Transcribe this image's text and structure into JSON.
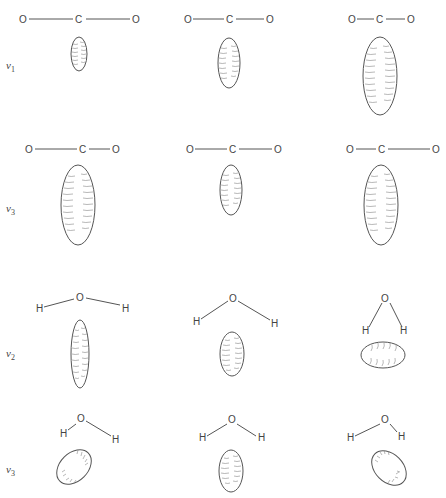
{
  "figure": {
    "colors": {
      "line": "#555555",
      "hatch": "#777777",
      "background": "#ffffff"
    }
  },
  "rows": [
    {
      "id": "co2-nu1",
      "label_symbol": "ν",
      "label_subscript": "1",
      "molecule": "CO2",
      "panels": [
        {
          "atoms": [
            "O",
            "C",
            "O"
          ],
          "geometry": "linear-stretched",
          "ellipsoid": "small-vertical"
        },
        {
          "atoms": [
            "O",
            "C",
            "O"
          ],
          "geometry": "linear-equilibrium",
          "ellipsoid": "medium-vertical"
        },
        {
          "atoms": [
            "O",
            "C",
            "O"
          ],
          "geometry": "linear-compressed",
          "ellipsoid": "large-vertical"
        }
      ]
    },
    {
      "id": "co2-nu3",
      "label_symbol": "ν",
      "label_subscript": "3",
      "molecule": "CO2",
      "panels": [
        {
          "atoms": [
            "O",
            "C",
            "O"
          ],
          "geometry": "asymmetric-left",
          "ellipsoid": "large-vertical"
        },
        {
          "atoms": [
            "O",
            "C",
            "O"
          ],
          "geometry": "linear-equilibrium",
          "ellipsoid": "medium-vertical"
        },
        {
          "atoms": [
            "O",
            "C",
            "O"
          ],
          "geometry": "asymmetric-right",
          "ellipsoid": "large-vertical"
        }
      ]
    },
    {
      "id": "h2o-nu2",
      "label_symbol": "ν",
      "label_subscript": "2",
      "molecule": "H2O",
      "panels": [
        {
          "atoms": [
            "H",
            "O",
            "H"
          ],
          "geometry": "bent-wide",
          "ellipsoid": "tall-vertical"
        },
        {
          "atoms": [
            "H",
            "O",
            "H"
          ],
          "geometry": "bent-equilibrium",
          "ellipsoid": "small-vertical"
        },
        {
          "atoms": [
            "H",
            "O",
            "H"
          ],
          "geometry": "bent-narrow",
          "ellipsoid": "horizontal"
        }
      ]
    },
    {
      "id": "h2o-nu3",
      "label_symbol": "ν",
      "label_subscript": "3",
      "molecule": "H2O",
      "panels": [
        {
          "atoms": [
            "H",
            "O",
            "H"
          ],
          "geometry": "asymmetric-right-long",
          "ellipsoid": "tilted-right"
        },
        {
          "atoms": [
            "H",
            "O",
            "H"
          ],
          "geometry": "bent-equilibrium",
          "ellipsoid": "small-vertical"
        },
        {
          "atoms": [
            "H",
            "O",
            "H"
          ],
          "geometry": "asymmetric-left-long",
          "ellipsoid": "tilted-left"
        }
      ]
    }
  ]
}
